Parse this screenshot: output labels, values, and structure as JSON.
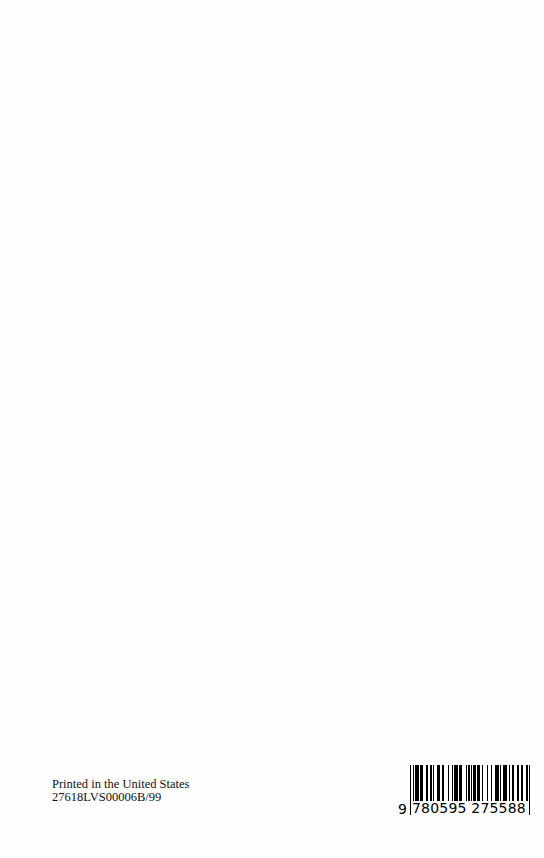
{
  "imprint": {
    "line1": "Printed in the United States",
    "line2": "27618LVS00006B/99"
  },
  "barcode": {
    "isbn_prefix_digit": "9",
    "digits": "780595 275588",
    "full": "9780595275588",
    "bar_color": "#000000"
  }
}
